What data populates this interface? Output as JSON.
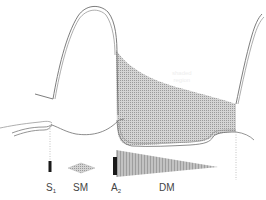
{
  "diagram": {
    "type": "pulse waveform with heart murmur timing",
    "colors": {
      "line": "#6e6e6e",
      "shade": "#b8b8b8",
      "marker": "#1a1a1a",
      "background": "#ffffff"
    },
    "legend": [
      {
        "id": "s1",
        "label": "S",
        "sub": "1",
        "shape": "bar"
      },
      {
        "id": "sm",
        "label": "SM",
        "sub": "",
        "shape": "diamond"
      },
      {
        "id": "a2",
        "label": "A",
        "sub": "2",
        "shape": "bar"
      },
      {
        "id": "dm",
        "label": "DM",
        "sub": "",
        "shape": "decrescendo-triangle"
      }
    ],
    "ghost_text": [
      "shaded",
      "region"
    ]
  }
}
